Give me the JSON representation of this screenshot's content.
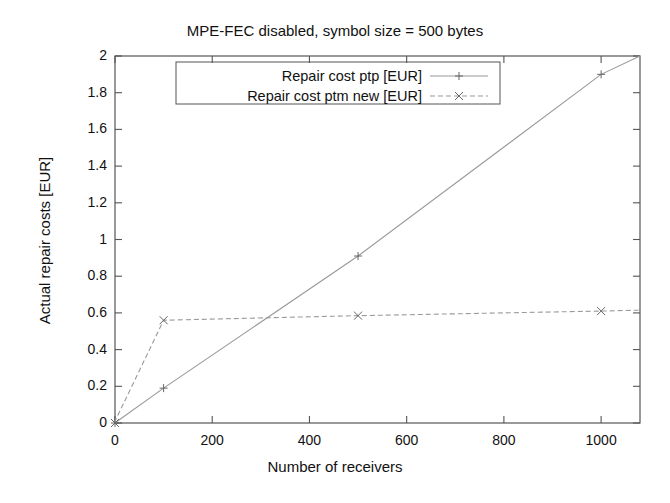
{
  "chart_data": {
    "type": "line",
    "title": "MPE-FEC disabled, symbol size = 500 bytes",
    "xlabel": "Number of receivers",
    "ylabel": "Actual repair costs [EUR]",
    "xlim": [
      0,
      1080
    ],
    "ylim": [
      0,
      2
    ],
    "grid": false,
    "legend_position": "top-center",
    "xticks": [
      0,
      200,
      400,
      600,
      800,
      1000
    ],
    "xtick_labels": [
      "0",
      "200",
      "400",
      "600",
      "800",
      "1000"
    ],
    "yticks": [
      0,
      0.2,
      0.4,
      0.6,
      0.8,
      1,
      1.2,
      1.4,
      1.6,
      1.8,
      2
    ],
    "ytick_labels": [
      "0",
      "0.2",
      "0.4",
      "0.6",
      "0.8",
      "1",
      "1.2",
      "1.4",
      "1.6",
      "1.8",
      "2"
    ],
    "series": [
      {
        "name": "Repair cost ptp [EUR]",
        "marker": "plus",
        "linestyle": "solid",
        "color": "#9a9a9a",
        "x": [
          0,
          1,
          100,
          500,
          1000,
          1080
        ],
        "y": [
          0,
          0.003,
          0.19,
          0.91,
          1.9,
          2.0
        ]
      },
      {
        "name": "Repair cost ptm new [EUR]",
        "marker": "cross",
        "linestyle": "dashed",
        "color": "#9a9a9a",
        "x": [
          0,
          1,
          100,
          500,
          1000,
          1080
        ],
        "y": [
          0,
          0.015,
          0.56,
          0.585,
          0.61,
          0.615
        ]
      }
    ]
  },
  "axes": {
    "frame_color": "#555555",
    "tick_color": "#555555"
  }
}
